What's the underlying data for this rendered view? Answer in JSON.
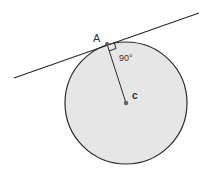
{
  "diagram": {
    "labels": {
      "point_a": "A",
      "angle": "90°",
      "center": "c"
    },
    "geometry": {
      "circle": {
        "cx": 126,
        "cy": 103,
        "r": 61
      },
      "tangent_line": {
        "x1": 14,
        "y1": 78,
        "x2": 199,
        "y2": 13
      },
      "radius": {
        "x1": 107,
        "y1": 44,
        "x2": 126,
        "y2": 103
      }
    },
    "colors": {
      "circle_fill": "#e6e6e6",
      "stroke": "#2a2a2a",
      "background": "#ffffff"
    }
  }
}
